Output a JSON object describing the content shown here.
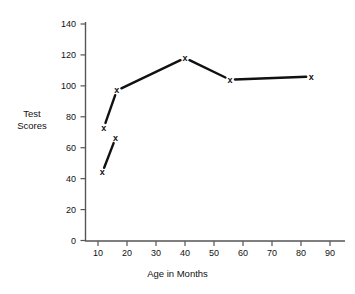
{
  "chart_data": {
    "type": "line",
    "title": "",
    "xlabel": "Age in Months",
    "ylabel": "Test Scores",
    "xlim": [
      5,
      95
    ],
    "ylim": [
      0,
      145
    ],
    "grid": false,
    "legend": "none",
    "xticks": [
      10,
      20,
      30,
      40,
      50,
      60,
      70,
      80,
      90
    ],
    "xtick_labels": [
      "10",
      "20",
      "30",
      "40",
      "50",
      "60",
      "70",
      "80",
      "90"
    ],
    "yticks": [
      0,
      20,
      40,
      60,
      80,
      100,
      120,
      140
    ],
    "ytick_labels": [
      "0",
      "20",
      "40",
      "60",
      "80",
      "100",
      "120",
      "140"
    ],
    "marker": "x",
    "series": [
      {
        "name": "lower-segment",
        "connected": true,
        "x": [
          11.5,
          16
        ],
        "values": [
          44,
          66
        ]
      },
      {
        "name": "upper-segment",
        "connected": true,
        "x": [
          12,
          16.5,
          40,
          55.5,
          83.5
        ],
        "values": [
          73,
          97,
          118,
          104,
          106
        ]
      }
    ],
    "points": [
      {
        "x": 11.5,
        "y": 44
      },
      {
        "x": 16,
        "y": 66
      },
      {
        "x": 12,
        "y": 73
      },
      {
        "x": 16.5,
        "y": 97
      },
      {
        "x": 40,
        "y": 118
      },
      {
        "x": 55.5,
        "y": 104
      },
      {
        "x": 83.5,
        "y": 106
      }
    ]
  },
  "axes": {
    "y_title_line1": "Test",
    "y_title_line2": "Scores",
    "x_title": "Age in Months"
  },
  "colors": {
    "line": "#111111",
    "axis": "#555555",
    "text": "#111111",
    "background": "#ffffff"
  }
}
